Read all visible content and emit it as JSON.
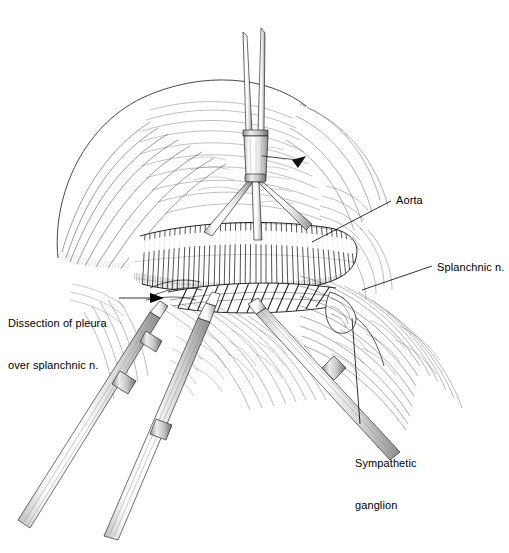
{
  "figure": {
    "width": 509,
    "height": 553,
    "background_color": "#ffffff",
    "ink_color": "#000000",
    "style": "line-hatching pen and ink"
  },
  "labels": [
    {
      "id": "dissection",
      "text": "Dissection of pleura\nover splanchnic n.",
      "line1": "Dissection of pleura",
      "line2": "over splanchnic n.",
      "pointer": "arrow",
      "x": 8,
      "y": 288
    },
    {
      "id": "aorta",
      "text": "Aorta",
      "pointer": "leader-line",
      "x": 396,
      "y": 193
    },
    {
      "id": "splanchnic",
      "text": "Splanchnic n.",
      "pointer": "leader-line",
      "x": 437,
      "y": 260
    },
    {
      "id": "ganglion",
      "text": "Sympathetic\nganglion",
      "line1": "Sympathetic",
      "line2": "ganglion",
      "pointer": "leader-line",
      "x": 355,
      "y": 428
    }
  ],
  "anatomy": [
    {
      "name": "aorta",
      "role": "large vessel, transverse cross-hatched cylinder at center"
    },
    {
      "name": "splanchnic-nerve",
      "role": "banded cord beneath dissected pleura"
    },
    {
      "name": "sympathetic-ganglion",
      "role": "nodal swelling on sympathetic chain"
    },
    {
      "name": "parietal-pleura",
      "role": "translucent membrane being incised"
    },
    {
      "name": "lung",
      "role": "retracted hatched mass upper left"
    },
    {
      "name": "chest-wall",
      "role": "radiating hatched tissue lower right"
    }
  ],
  "instruments": [
    {
      "name": "grasping-forceps",
      "position": "top center, two fine prongs elevating pleura"
    },
    {
      "name": "dissector-left",
      "position": "lower left shaft"
    },
    {
      "name": "dissector-center",
      "position": "lower center shaft"
    },
    {
      "name": "retractor-right",
      "position": "lower right shaft"
    }
  ]
}
